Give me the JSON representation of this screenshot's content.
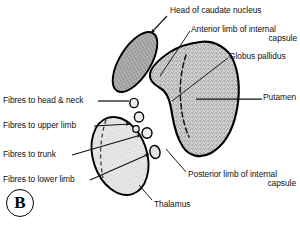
{
  "figure": {
    "panel_id": "B",
    "background_color": "#ffffff",
    "ink_color": "#000000"
  },
  "labels": {
    "head_of_caudate": "Head of caudate nucleus",
    "anterior_limb": "Anterior limb of internal capsule",
    "anterior_limb_line1": "Anterior limb of internal",
    "anterior_limb_line2": "capsule",
    "globus_pallidus": "Globus pallidus",
    "putamen": "Putamen",
    "posterior_limb": "Posterior limb of internal capsule",
    "posterior_limb_line1": "Posterior limb of internal",
    "posterior_limb_line2": "capsule",
    "thalamus": "Thalamus",
    "fibres_head_neck": "Fibres to head & neck",
    "fibres_upper_limb": "Fibres to upper limb",
    "fibres_trunk": "Fibres to trunk",
    "fibres_lower_limb": "Fibres to lower limb"
  },
  "structures": {
    "caudate": {
      "name": "Head of caudate nucleus",
      "fill": "#b9b9b9",
      "texture": "cross-hatch"
    },
    "lentiform": {
      "name": "Lentiform nucleus (globus pallidus + putamen)",
      "fill": "#c9c9c9",
      "texture": "stipple"
    },
    "thalamus": {
      "name": "Thalamus",
      "fill": "#e4e4e4",
      "texture": "fine-stipple"
    },
    "fibre_bundles": {
      "name": "Corticospinal fibre bundles",
      "count": 5,
      "fill": "#e8e8e8"
    }
  },
  "colors": {
    "outline": "#000000",
    "caudate_fill": "#b9b9b9",
    "lentiform_fill": "#c9c9c9",
    "thalamus_fill": "#e4e4e4",
    "leader_line": "#1a1a1a"
  }
}
